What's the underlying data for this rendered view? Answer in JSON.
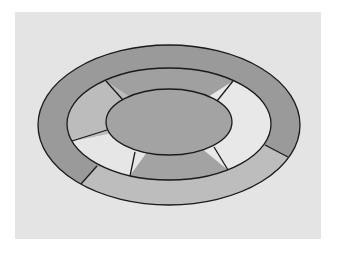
{
  "diagram": {
    "colors": {
      "page_background": "#ffffff",
      "panel_background": "#e4e4e4",
      "stroke": "#1a1a1a",
      "outer_dark": "#9a9a9a",
      "outer_light": "#bdbdbd",
      "middle_top": "#a0a0a0",
      "middle_upper_left": "#bcbcbc",
      "middle_lower_left": "#e6e6e6",
      "middle_bottom": "#a3a3a3",
      "middle_right": "#e8e8e8",
      "inner": "#a3a3a3"
    },
    "rings": [
      {
        "name": "outer-ring",
        "segments": [
          "dark",
          "light"
        ]
      },
      {
        "name": "middle-ring",
        "segments": [
          "top",
          "upper-left",
          "lower-left",
          "bottom",
          "right"
        ]
      },
      {
        "name": "inner-ellipse",
        "segments": [
          "solid"
        ]
      }
    ]
  }
}
